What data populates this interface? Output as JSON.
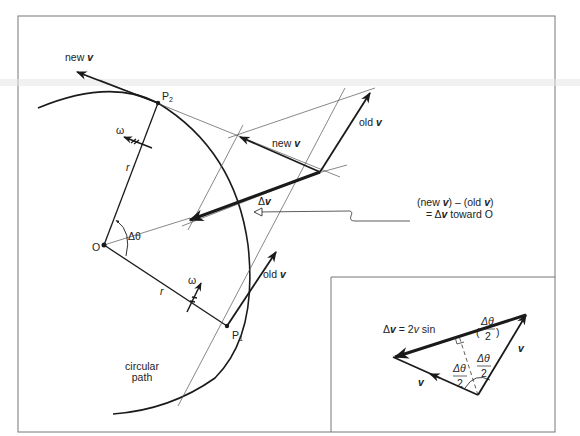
{
  "figure": {
    "type": "physics-diagram",
    "colors": {
      "ink": "#1a1a1a",
      "thin_line": "#555555",
      "frame": "#777777",
      "background": "#ffffff"
    }
  },
  "labels": {
    "new_v_top": "new ",
    "new_v_top_v": "v",
    "p2": "P",
    "p2_sub": "2",
    "p1": "P",
    "p1_sub": "1",
    "omega_top": "ω",
    "omega_bottom": "ω",
    "r_top": "r",
    "r_bottom": "r",
    "origin": "O",
    "delta_theta": "Δθ",
    "new_v_mid": "new ",
    "new_v_mid_v": "v",
    "old_v_top": "old ",
    "old_v_top_v": "v",
    "old_v_bottom": "old ",
    "old_v_bottom_v": "v",
    "delta_v": "Δ",
    "delta_v_v": "v",
    "circular_path_line1": "circular",
    "circular_path_line2": "path",
    "annotation_line1_a": "(new ",
    "annotation_line1_v1": "v",
    "annotation_line1_b": ")  –  (old ",
    "annotation_line1_v2": "v",
    "annotation_line1_c": ")",
    "annotation_line2_a": "=  Δ",
    "annotation_line2_v": "v",
    "annotation_line2_b": " toward O"
  },
  "inset": {
    "formula_lhs": "Δ",
    "formula_lhs_v": "v",
    "formula_eq": " = 2",
    "formula_v": "v",
    "formula_sin": " sin",
    "frac_num": "Δθ",
    "frac_den": "2",
    "left_half_num": "Δθ",
    "left_half_den": "2",
    "right_half_num": "Δθ",
    "right_half_den": "2",
    "v_left": "v",
    "v_right": "v"
  }
}
